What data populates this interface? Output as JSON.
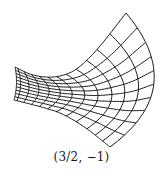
{
  "figure": {
    "caption": "(3/2, −1)",
    "stroke_color": "#1a1a1a",
    "background": "#ffffff",
    "grid": {
      "columns": 13,
      "rows": 11,
      "column_spacing_exponent": 1.8,
      "top_boundary": [
        [
          15,
          67
        ],
        [
          30,
          74
        ],
        [
          45,
          77
        ],
        [
          60,
          76
        ],
        [
          75,
          70
        ],
        [
          90,
          57
        ],
        [
          105,
          40
        ],
        [
          126,
          13
        ]
      ],
      "bottom_boundary": [
        [
          14,
          100
        ],
        [
          30,
          104
        ],
        [
          45,
          108
        ],
        [
          60,
          113
        ],
        [
          75,
          121
        ],
        [
          90,
          131
        ],
        [
          100,
          139
        ],
        [
          110,
          147
        ]
      ],
      "bulge_start": 2,
      "bulge_end": 36
    }
  }
}
